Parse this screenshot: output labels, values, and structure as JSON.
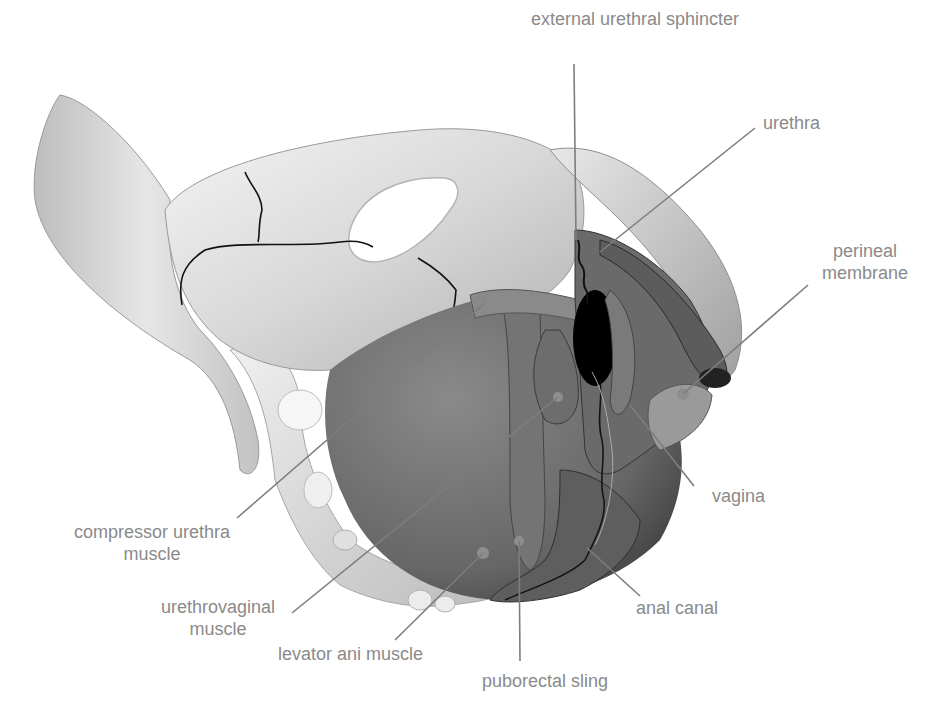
{
  "figure": {
    "colors": {
      "label_text": "#8a8a8a",
      "leader_line": "#7d7d7d",
      "bone_light": "#ededed",
      "bone_mid": "#c9c9c9",
      "muscle_dark": "#5a5a5a",
      "muscle_mid": "#7a7a7a",
      "opening": "#000000",
      "suture_line": "#111111"
    }
  },
  "labels": [
    {
      "id": "external-urethral-sphincter",
      "text": "external urethral sphincter"
    },
    {
      "id": "urethra",
      "text": "urethra"
    },
    {
      "id": "perineal-membrane",
      "line1": "perineal",
      "line2": "membrane"
    },
    {
      "id": "vagina",
      "text": "vagina"
    },
    {
      "id": "compressor-urethra-muscle",
      "line1": "compressor urethra",
      "line2": "muscle"
    },
    {
      "id": "urethrovaginal-muscle",
      "line1": "urethrovaginal",
      "line2": "muscle"
    },
    {
      "id": "levator-ani-muscle",
      "text": "levator ani muscle"
    },
    {
      "id": "anal-canal",
      "text": "anal canal"
    },
    {
      "id": "puborectal-sling",
      "text": "puborectal sling"
    }
  ]
}
